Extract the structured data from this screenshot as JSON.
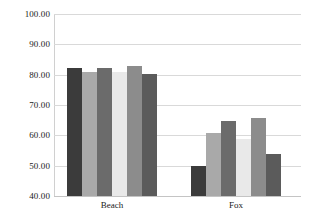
{
  "chart_data": {
    "type": "bar",
    "title": "",
    "subtitle": "",
    "xlabel": "",
    "ylabel": "",
    "ylim": [
      40,
      100
    ],
    "ytick_labels": [
      "100.00",
      "90.00",
      "80.00",
      "70.00",
      "60.00",
      "50.00",
      "40.00"
    ],
    "yticks": [
      100,
      90,
      80,
      70,
      60,
      50,
      40
    ],
    "grid": true,
    "legend": "none",
    "categories": [
      "Beach",
      "Fox"
    ],
    "series": [
      {
        "name": "Series 1",
        "color": "#3b3b3b",
        "values": [
          82.3,
          50.0
        ]
      },
      {
        "name": "Series 2",
        "color": "#a9a9a9",
        "values": [
          81.0,
          60.8
        ]
      },
      {
        "name": "Series 3",
        "color": "#6b6b6b",
        "values": [
          82.3,
          64.8
        ]
      },
      {
        "name": "Series 4",
        "color": "#e9e9e9",
        "values": [
          80.8,
          58.8
        ]
      },
      {
        "name": "Series 5",
        "color": "#8c8c8c",
        "values": [
          83.0,
          65.8
        ]
      },
      {
        "name": "Series 6",
        "color": "#5b5b5b",
        "values": [
          80.3,
          53.8
        ]
      }
    ]
  }
}
